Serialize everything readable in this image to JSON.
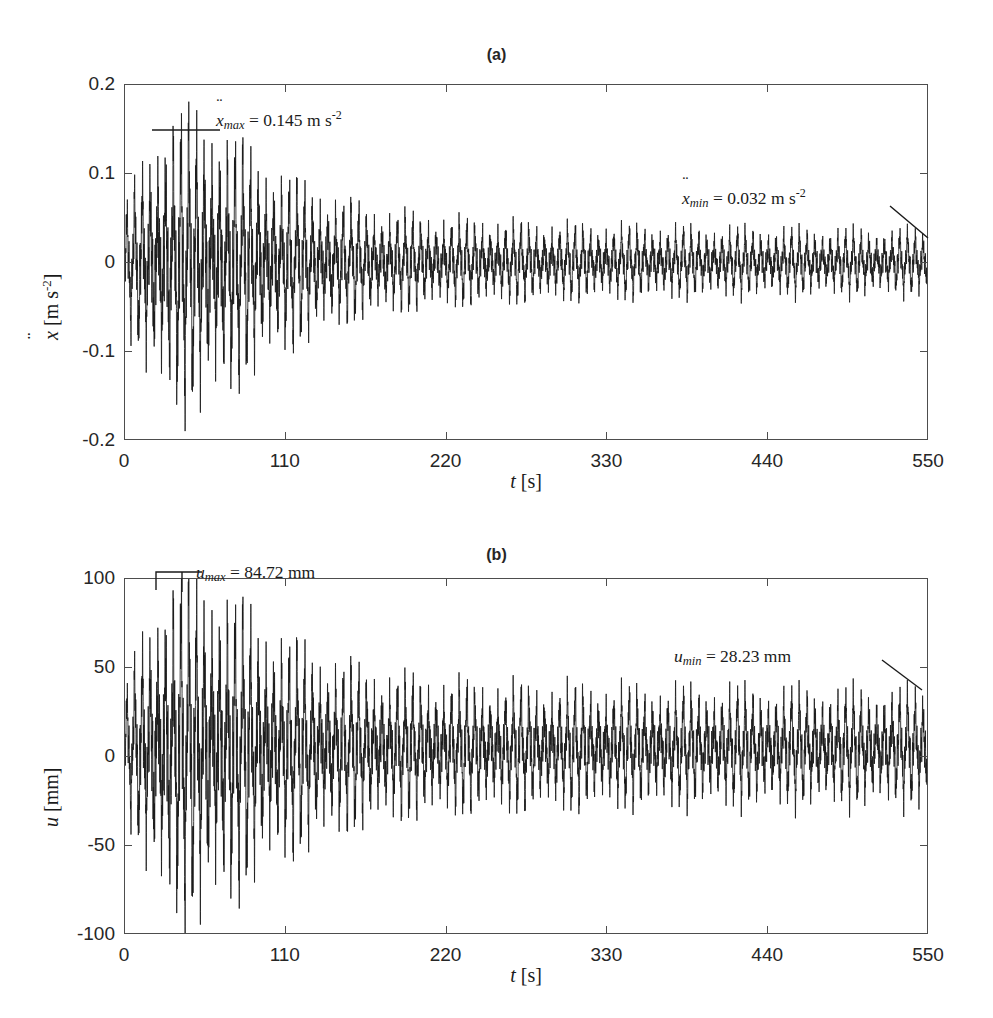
{
  "figure": {
    "width": 993,
    "height": 1018,
    "background": "#ffffff",
    "line_color": "#1a1a1a",
    "axis_color": "#4d4d4d"
  },
  "panels": [
    {
      "id": "a",
      "title": "(a)",
      "ylabel_var": "x",
      "ylabel_unit": "[m s",
      "ylabel_unit_sup": "-2",
      "ylabel_unit_close": "]",
      "xlabel_var": "t",
      "xlabel_unit": "[s]",
      "yticks": [
        "0.2",
        "0.1",
        "0",
        "-0.1",
        "-0.2"
      ],
      "xticks": [
        "0",
        "110",
        "220",
        "330",
        "440",
        "550"
      ],
      "annotations": [
        {
          "name": "xddot-max",
          "var": "x",
          "sub": "max",
          "text": " = 0.145 m s",
          "sup": "-2"
        },
        {
          "name": "xddot-min",
          "var": "x",
          "sub": "min",
          "text": " = 0.032 m s",
          "sup": "-2"
        }
      ]
    },
    {
      "id": "b",
      "title": "(b)",
      "ylabel_var": "u",
      "ylabel_unit": "[mm]",
      "ylabel_unit_sup": "",
      "ylabel_unit_close": "",
      "xlabel_var": "t",
      "xlabel_unit": "[s]",
      "yticks": [
        "100",
        "50",
        "0",
        "-50",
        "-100"
      ],
      "xticks": [
        "0",
        "110",
        "220",
        "330",
        "440",
        "550"
      ],
      "annotations": [
        {
          "name": "u-max",
          "var": "u",
          "sub": "max",
          "text": " = 84.72 mm",
          "sup": ""
        },
        {
          "name": "u-min",
          "var": "u",
          "sub": "min",
          "text": " = 28.23 mm",
          "sup": ""
        }
      ]
    }
  ],
  "chart_data": [
    {
      "type": "line",
      "panel": "a",
      "title": "(a)",
      "xlabel": "t [s]",
      "ylabel": "ẍ [m s-2]",
      "xlim": [
        0,
        550
      ],
      "ylim": [
        -0.2,
        0.2
      ],
      "xticks": [
        0,
        110,
        220,
        330,
        440,
        550
      ],
      "yticks": [
        -0.2,
        -0.1,
        0,
        0.1,
        0.2
      ],
      "grid": false,
      "legend": null,
      "series_name": "acceleration",
      "units": "m s^-2",
      "signal_model": {
        "description": "Amplitude-modulated beating oscillation: slow envelope rises from small initial amplitude to a peak near t=45 s then decays to a steady plateau; superimposed dense high-frequency carrier plus discrete spikes.",
        "carrier_period_s": 5.3,
        "fine_period_s": 0.55,
        "mean_offset": 0.0,
        "envelope_t_s": [
          0,
          5,
          12,
          20,
          28,
          36,
          45,
          55,
          68,
          80,
          92,
          105,
          120,
          135,
          150,
          165,
          180,
          200,
          220,
          245,
          270,
          300,
          330,
          360,
          400,
          440,
          480,
          520,
          550
        ],
        "envelope_amp": [
          0.052,
          0.072,
          0.098,
          0.12,
          0.134,
          0.142,
          0.145,
          0.14,
          0.128,
          0.115,
          0.102,
          0.09,
          0.078,
          0.068,
          0.06,
          0.054,
          0.05,
          0.046,
          0.043,
          0.041,
          0.039,
          0.037,
          0.036,
          0.035,
          0.034,
          0.033,
          0.0325,
          0.032,
          0.032
        ],
        "core_band_fraction": 0.42
      },
      "annotations": [
        {
          "label": "ẍmax = 0.145 m s-2",
          "value": 0.145,
          "at_t": 45
        },
        {
          "label": "ẍmin = 0.032 m s-2",
          "value": 0.032,
          "at_t": 550
        }
      ]
    },
    {
      "type": "line",
      "panel": "b",
      "title": "(b)",
      "xlabel": "t [s]",
      "ylabel": "u [mm]",
      "xlim": [
        0,
        550
      ],
      "ylim": [
        -100,
        100
      ],
      "xticks": [
        0,
        110,
        220,
        330,
        440,
        550
      ],
      "yticks": [
        -100,
        -50,
        0,
        50,
        100
      ],
      "grid": false,
      "legend": null,
      "series_name": "displacement",
      "units": "mm",
      "signal_model": {
        "description": "Same beating modulation as panel (a) with a small positive mean offset; envelope peaks at 84.72 mm near t=45 s and settles to a 28.23 mm plateau.",
        "carrier_period_s": 5.3,
        "fine_period_s": 0.55,
        "mean_offset": 5.0,
        "envelope_t_s": [
          0,
          5,
          12,
          20,
          28,
          36,
          45,
          55,
          68,
          80,
          92,
          105,
          120,
          135,
          150,
          165,
          180,
          200,
          220,
          245,
          270,
          300,
          330,
          360,
          400,
          440,
          480,
          520,
          550
        ],
        "envelope_amp": [
          26,
          38,
          55,
          68,
          78,
          83,
          84.72,
          82,
          76,
          69,
          62,
          56,
          50,
          45,
          41,
          38,
          36,
          34,
          32.5,
          31.5,
          30.5,
          30,
          29.5,
          29.2,
          28.9,
          28.7,
          28.5,
          28.3,
          28.23
        ],
        "core_band_fraction": 0.42
      },
      "annotations": [
        {
          "label": "umax = 84.72 mm",
          "value": 84.72,
          "at_t": 45
        },
        {
          "label": "umin = 28.23 mm",
          "value": 28.23,
          "at_t": 550
        }
      ]
    }
  ]
}
